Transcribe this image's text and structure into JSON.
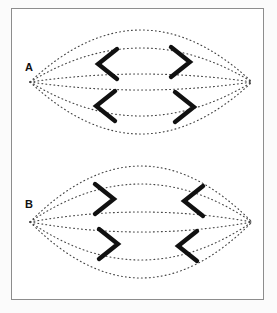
{
  "figure": {
    "background_color": "#fbfbfb",
    "frame_color": "#8d8d8d",
    "ink_color": "#111111",
    "dot_color": "#444444",
    "panels": [
      {
        "label": "A",
        "lens": {
          "left_vertex_x": 18,
          "right_vertex_x": 240,
          "center_y": 73,
          "arc_offsets": [
            52,
            34,
            8,
            -8,
            -34,
            -52
          ],
          "style": "dotted"
        },
        "chevrons": [
          {
            "name": "top-left-chevron",
            "direction": "left",
            "glyph": "<",
            "cx": 92,
            "cy": 55
          },
          {
            "name": "top-right-chevron",
            "direction": "right",
            "glyph": ">",
            "cx": 172,
            "cy": 53
          },
          {
            "name": "bottom-left-chevron",
            "direction": "left",
            "glyph": "<",
            "cx": 90,
            "cy": 97
          },
          {
            "name": "bottom-right-chevron",
            "direction": "right",
            "glyph": ">",
            "cx": 176,
            "cy": 98
          }
        ]
      },
      {
        "label": "B",
        "lens": {
          "left_vertex_x": 18,
          "right_vertex_x": 240,
          "center_y": 73,
          "arc_offsets": [
            56,
            38,
            10,
            -10,
            -38,
            -56
          ],
          "style": "dotted"
        },
        "chevrons": [
          {
            "name": "top-left-chevron",
            "direction": "right",
            "glyph": ">",
            "cx": 96,
            "cy": 50
          },
          {
            "name": "top-right-chevron",
            "direction": "left",
            "glyph": "<",
            "cx": 178,
            "cy": 52
          },
          {
            "name": "bottom-left-chevron",
            "direction": "right",
            "glyph": ">",
            "cx": 100,
            "cy": 95
          },
          {
            "name": "bottom-right-chevron",
            "direction": "left",
            "glyph": "<",
            "cx": 172,
            "cy": 97
          }
        ]
      }
    ]
  },
  "chart_data": {
    "type": "diagram",
    "title": "",
    "panels": [
      {
        "label": "A",
        "chevron_directions": {
          "top_left": "left",
          "top_right": "right",
          "bottom_left": "left",
          "bottom_right": "right"
        }
      },
      {
        "label": "B",
        "chevron_directions": {
          "top_left": "right",
          "top_right": "left",
          "bottom_left": "right",
          "bottom_right": "left"
        }
      }
    ]
  }
}
